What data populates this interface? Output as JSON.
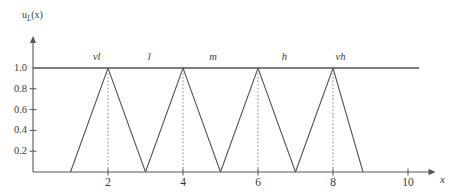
{
  "figure": {
    "background": "#ffffff",
    "line_color": "#555555",
    "text_color": "#3a3a3a",
    "dotted_color": "#888888"
  },
  "axes": {
    "y_axis_label": "u",
    "y_axis_label_sub": "L",
    "y_axis_label_arg": "(x)",
    "x_axis_label": "x"
  },
  "chart_data": {
    "type": "line",
    "title": "",
    "subtitle": "",
    "xlabel": "x",
    "ylabel": "u_L(x)",
    "xlim": [
      0,
      10.6
    ],
    "ylim": [
      0,
      1.28
    ],
    "grid": false,
    "legend_position": "inline-top",
    "x_ticks": [
      2,
      4,
      6,
      8,
      10
    ],
    "x_tick_labels": [
      "2",
      "4",
      "6",
      "8",
      "10"
    ],
    "y_ticks": [
      0.2,
      0.4,
      0.6,
      0.8,
      1.0
    ],
    "y_tick_labels": [
      "0.2",
      "0.4",
      "0.6",
      "0.8",
      "1.0"
    ],
    "unity_line": {
      "y": 1.0,
      "x_start": 0,
      "x_end": 10.3
    },
    "linguistic_terms": [
      {
        "name": "vl",
        "label_x": 1.7,
        "label_y": 1.1
      },
      {
        "name": "l",
        "label_x": 3.1,
        "label_y": 1.1
      },
      {
        "name": "m",
        "label_x": 4.8,
        "label_y": 1.1
      },
      {
        "name": "h",
        "label_x": 6.7,
        "label_y": 1.1
      },
      {
        "name": "vh",
        "label_x": 8.2,
        "label_y": 1.1
      }
    ],
    "series": [
      {
        "name": "vl",
        "type": "triangular",
        "left": 1,
        "peak": 2,
        "right": 3,
        "height": 1.0,
        "points": [
          [
            1,
            0
          ],
          [
            2,
            1
          ],
          [
            3,
            0
          ]
        ]
      },
      {
        "name": "l",
        "type": "triangular",
        "left": 3,
        "peak": 4,
        "right": 5,
        "height": 1.0,
        "points": [
          [
            3,
            0
          ],
          [
            4,
            1
          ],
          [
            5,
            0
          ]
        ]
      },
      {
        "name": "m",
        "type": "triangular",
        "left": 5,
        "peak": 6,
        "right": 7,
        "height": 1.0,
        "points": [
          [
            5,
            0
          ],
          [
            6,
            1
          ],
          [
            7,
            0
          ]
        ]
      },
      {
        "name": "h",
        "type": "triangular",
        "left": 7,
        "peak": 8,
        "right": 8.8,
        "height": 1.0,
        "points": [
          [
            7,
            0
          ],
          [
            8,
            1
          ],
          [
            8.8,
            0
          ]
        ]
      }
    ],
    "peak_guides": [
      {
        "x": 2,
        "y_from": 0,
        "y_to": 1.0
      },
      {
        "x": 4,
        "y_from": 0,
        "y_to": 1.0
      },
      {
        "x": 6,
        "y_from": 0,
        "y_to": 1.0
      },
      {
        "x": 8,
        "y_from": 0,
        "y_to": 1.0
      }
    ]
  }
}
